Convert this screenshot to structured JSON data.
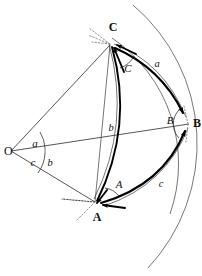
{
  "figure": {
    "background_color": "#ffffff",
    "ink_color": "#000000"
  },
  "points": {
    "origin": {
      "label": "O",
      "x": 11,
      "y": 151
    },
    "vertex_a": {
      "label": "A",
      "x": 97,
      "y": 215
    },
    "vertex_b": {
      "label": "B",
      "x": 191,
      "y": 123
    },
    "vertex_c": {
      "label": "C",
      "x": 113,
      "y": 31
    }
  },
  "side_labels": {
    "arc_a": {
      "text": "a",
      "x": 157,
      "y": 64
    },
    "arc_b_mid": {
      "text": "b",
      "x": 111,
      "y": 128
    },
    "arc_c": {
      "text": "c",
      "x": 161,
      "y": 184
    },
    "central_b": {
      "text": "b",
      "x": 50,
      "y": 163
    }
  },
  "angle_labels": {
    "vertex_angle_a": {
      "text": "A",
      "x": 119,
      "y": 184
    },
    "vertex_angle_b": {
      "text": "B",
      "x": 170,
      "y": 120
    },
    "vertex_angle_c": {
      "text": "C",
      "x": 128,
      "y": 69
    },
    "central_a": {
      "text": "a",
      "x": 35,
      "y": 144
    },
    "central_c": {
      "text": "c",
      "x": 33,
      "y": 162
    }
  },
  "colors": {
    "stroke_primary": "#000000",
    "stroke_secondary": "#2b2b2b",
    "stroke_faint": "#8a8a8a",
    "sphere_arc": "#555555"
  }
}
